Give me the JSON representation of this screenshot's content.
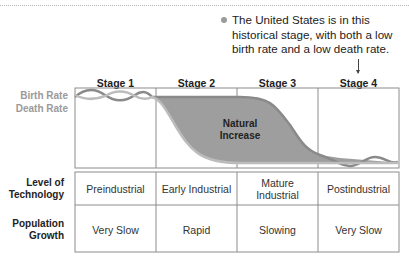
{
  "note": {
    "lines": [
      "The United States is in this",
      "historical stage, with both a low",
      "birth rate and a low death rate."
    ]
  },
  "axis": {
    "birth_rate": "Birth Rate",
    "death_rate": "Death Rate"
  },
  "stages": [
    "Stage 1",
    "Stage 2",
    "Stage 3",
    "Stage 4"
  ],
  "annotation": {
    "line1": "Natural",
    "line2": "Increase"
  },
  "table": {
    "rows": [
      {
        "label_line1": "Level of",
        "label_line2": "Technology",
        "cells": [
          {
            "line1": "Preindustrial",
            "line2": ""
          },
          {
            "line1": "Early Industrial",
            "line2": ""
          },
          {
            "line1": "Mature",
            "line2": "Industrial"
          },
          {
            "line1": "Postindustrial",
            "line2": ""
          }
        ]
      },
      {
        "label_line1": "Population",
        "label_line2": "Growth",
        "cells": [
          {
            "line1": "Very Slow",
            "line2": ""
          },
          {
            "line1": "Rapid",
            "line2": ""
          },
          {
            "line1": "Slowing",
            "line2": ""
          },
          {
            "line1": "Very Slow",
            "line2": ""
          }
        ]
      }
    ]
  },
  "colors": {
    "fill": "#9e9e9e",
    "birth_line": "#8a8a8a",
    "death_line": "#bcbcbc",
    "grid": "#8c8c8c"
  }
}
